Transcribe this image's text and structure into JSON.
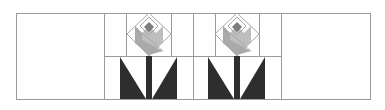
{
  "diagram": {
    "colors": {
      "background": "#ffffff",
      "grid_line": "#9a9a9a",
      "diamond_outline": "#a8a8a8",
      "petal_light": "#bdbdbd",
      "petal_mid": "#a9a9a9",
      "center": "#7d7d7d",
      "leaf": "#2e2e2e",
      "stem": "#2e2e2e"
    },
    "outer": {
      "x": 16,
      "y": 13,
      "w": 354,
      "h": 86
    },
    "dividers_x": [
      104,
      193,
      281
    ],
    "mid_line": {
      "y": 56,
      "x1": 104,
      "x2": 281
    },
    "blocks": [
      {
        "name": "empty-block-left",
        "x": 16,
        "w": 88
      },
      {
        "name": "tulip-block-1",
        "x": 104,
        "w": 89,
        "cx": 149,
        "inner_x": [
          126,
          171
        ]
      },
      {
        "name": "tulip-block-2",
        "x": 193,
        "w": 88,
        "cx": 237,
        "inner_x": [
          215,
          259
        ]
      },
      {
        "name": "empty-block-right",
        "x": 281,
        "w": 89
      }
    ]
  }
}
